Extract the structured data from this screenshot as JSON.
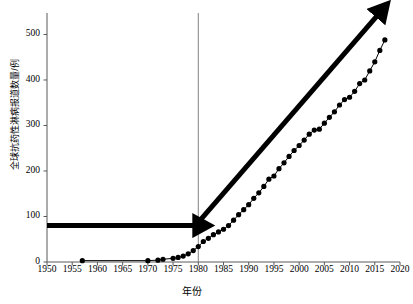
{
  "chart_data": {
    "type": "line",
    "title": "",
    "subtitle": "",
    "xlabel": "年份",
    "ylabel": "全球抗药性淋病报道数量/例",
    "xlim": [
      1950,
      2020
    ],
    "ylim": [
      0,
      545
    ],
    "xticks": [
      1950,
      1955,
      1960,
      1965,
      1970,
      1975,
      1980,
      1985,
      1990,
      1995,
      2000,
      2005,
      2010,
      2015,
      2020
    ],
    "yticks": [
      0,
      100,
      200,
      300,
      400,
      500
    ],
    "grid": false,
    "legend": "none",
    "marker": "filled-circle",
    "series": [
      {
        "name": "全球抗药性淋病报道数量",
        "x": [
          1957,
          1970,
          1972,
          1973,
          1975,
          1976,
          1977,
          1978,
          1979,
          1980,
          1981,
          1982,
          1983,
          1984,
          1985,
          1986,
          1987,
          1988,
          1989,
          1990,
          1991,
          1992,
          1993,
          1994,
          1995,
          1996,
          1997,
          1998,
          1999,
          2000,
          2001,
          2002,
          2003,
          2004,
          2005,
          2006,
          2007,
          2008,
          2009,
          2010,
          2011,
          2012,
          2013,
          2014,
          2015,
          2016,
          2017
        ],
        "values": [
          3,
          3,
          4,
          6,
          8,
          10,
          13,
          18,
          25,
          34,
          45,
          52,
          60,
          66,
          72,
          80,
          92,
          104,
          115,
          126,
          140,
          152,
          166,
          182,
          189,
          205,
          218,
          232,
          245,
          256,
          268,
          281,
          290,
          292,
          305,
          318,
          330,
          345,
          357,
          362,
          375,
          392,
          400,
          420,
          440,
          465,
          488
        ]
      }
    ],
    "annotations": [
      {
        "name": "reference-line-1980",
        "type": "vertical-line",
        "x": 1980,
        "color": "#808080"
      },
      {
        "name": "horizontal-arrow",
        "type": "arrow",
        "x_start": 1950,
        "y_start": 80,
        "x_end": 1980,
        "y_end": 80,
        "color": "#000000"
      },
      {
        "name": "diagonal-trend-arrow",
        "type": "arrow",
        "x_start": 1980,
        "y_start": 87,
        "x_end": 2016,
        "y_end": 548,
        "color": "#000000"
      }
    ]
  }
}
